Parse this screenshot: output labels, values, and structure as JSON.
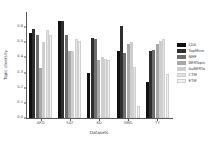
{
  "chart_data": {
    "type": "bar",
    "title": "",
    "xlabel": "Datasets",
    "ylabel": "Topic diversity",
    "categories": [
      "AFD",
      "SAT",
      "KU",
      "SMG",
      "TY"
    ],
    "ylim": [
      0.0,
      0.7
    ],
    "yticks": [
      "0.0",
      "0.1",
      "0.2",
      "0.3",
      "0.4",
      "0.5",
      "0.6"
    ],
    "ytick_values": [
      0.0,
      0.1,
      0.2,
      0.3,
      0.4,
      0.5,
      0.6
    ],
    "grid": false,
    "legend_position": "right",
    "series": [
      {
        "name": "LDA",
        "color": "#111111",
        "values": [
          0.56,
          0.64,
          0.3,
          0.44,
          0.24
        ]
      },
      {
        "name": "TopMine",
        "color": "#2e2e2e",
        "values": [
          0.59,
          0.64,
          0.53,
          0.61,
          0.44
        ]
      },
      {
        "name": "NMF",
        "color": "#6e6e6e",
        "values": [
          0.55,
          0.55,
          0.52,
          0.43,
          0.45
        ]
      },
      {
        "name": "BERTopic",
        "color": "#a8a8a8",
        "values": [
          0.33,
          0.44,
          0.38,
          0.49,
          0.49
        ]
      },
      {
        "name": "AuBERTa",
        "color": "#cccccc",
        "values": [
          0.5,
          0.44,
          0.4,
          0.5,
          0.51
        ]
      },
      {
        "name": "CTM",
        "color": "#e2e2e2",
        "values": [
          0.58,
          0.52,
          0.39,
          0.34,
          0.52
        ]
      },
      {
        "name": "ETM",
        "color": "#f2f2f2",
        "values": [
          0.55,
          0.51,
          0.38,
          0.08,
          0.29
        ]
      }
    ]
  }
}
